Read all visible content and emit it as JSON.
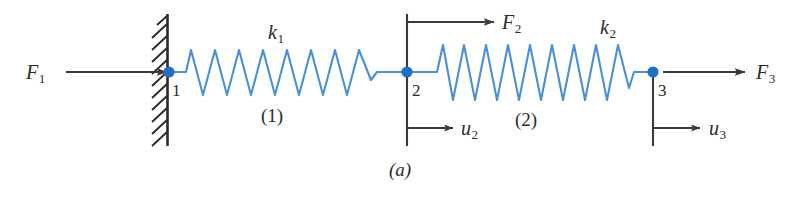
{
  "figure": {
    "caption": "(a)",
    "colors": {
      "spring": "#4a90d9",
      "node": "#1f6fc4",
      "line": "#3a3a3a",
      "background": "#ffffff"
    }
  },
  "support": {
    "type": "fixed-wall",
    "hatch_count": 11
  },
  "nodes": [
    {
      "id": "node-1",
      "label": "1"
    },
    {
      "id": "node-2",
      "label": "2"
    },
    {
      "id": "node-3",
      "label": "3"
    }
  ],
  "elements": [
    {
      "id": "element-1",
      "label": "(1)",
      "stiffness_symbol": "k",
      "stiffness_sub": "1",
      "coils": 8
    },
    {
      "id": "element-2",
      "label": "(2)",
      "stiffness_symbol": "k",
      "stiffness_sub": "2",
      "coils": 9
    }
  ],
  "forces": [
    {
      "id": "force-1",
      "symbol": "F",
      "sub": "1",
      "direction": "right"
    },
    {
      "id": "force-2",
      "symbol": "F",
      "sub": "2",
      "direction": "right"
    },
    {
      "id": "force-3",
      "symbol": "F",
      "sub": "3",
      "direction": "right"
    }
  ],
  "displacements": [
    {
      "id": "displacement-2",
      "symbol": "u",
      "sub": "2",
      "direction": "right"
    },
    {
      "id": "displacement-3",
      "symbol": "u",
      "sub": "3",
      "direction": "right"
    }
  ]
}
